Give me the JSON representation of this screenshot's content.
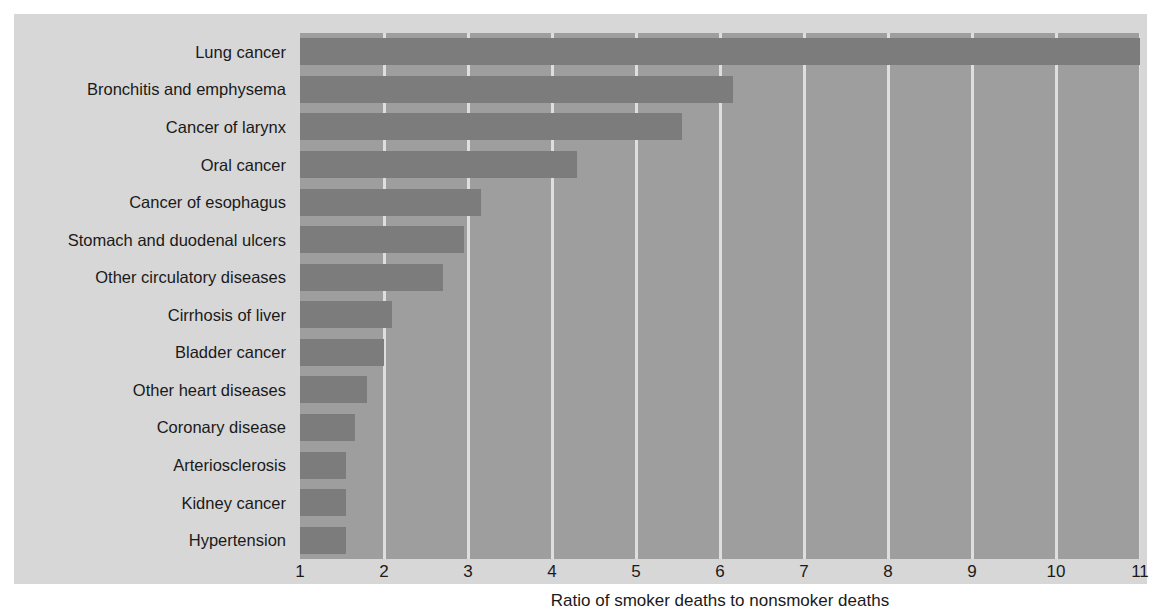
{
  "chart_data": {
    "type": "bar",
    "orientation": "horizontal",
    "title": "",
    "subtitle": "",
    "xlabel": "Ratio of smoker deaths to nonsmoker deaths",
    "ylabel": "",
    "xlim": [
      1,
      11
    ],
    "xticks": [
      "1",
      "2",
      "3",
      "4",
      "5",
      "6",
      "7",
      "8",
      "9",
      "10",
      "11"
    ],
    "grid": "vertical",
    "legend": "none",
    "categories": [
      "Lung cancer",
      "Bronchitis and emphysema",
      "Cancer of larynx",
      "Oral cancer",
      "Cancer of esophagus",
      "Stomach and duodenal ulcers",
      "Other circulatory diseases",
      "Cirrhosis of liver",
      "Bladder cancer",
      "Other heart diseases",
      "Coronary disease",
      "Arteriosclerosis",
      "Kidney cancer",
      "Hypertension"
    ],
    "values": [
      11.0,
      6.15,
      5.55,
      4.3,
      3.15,
      2.95,
      2.7,
      2.1,
      2.0,
      1.8,
      1.65,
      1.55,
      1.55,
      1.55
    ]
  },
  "style": {
    "bar_color": "#7c7c7c",
    "plot_background": "#9e9e9e",
    "figure_background": "#d7d7d7",
    "gridline_color": "#e9e9e9",
    "text_color": "#1a1a1a",
    "page_background": "#ffffff"
  }
}
